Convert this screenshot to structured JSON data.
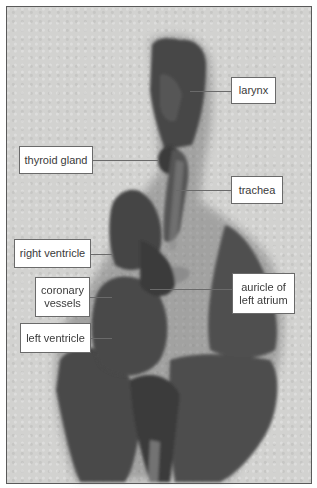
{
  "figure": {
    "labels": [
      {
        "id": "larynx",
        "text": "larynx"
      },
      {
        "id": "thyroid-gland",
        "text": "thyroid gland"
      },
      {
        "id": "trachea",
        "text": "trachea"
      },
      {
        "id": "right-ventricle",
        "text": "right ventricle"
      },
      {
        "id": "coronary-vessels",
        "line1": "coronary",
        "line2": "vessels"
      },
      {
        "id": "auricle-left-atrium",
        "line1": "auricle of",
        "line2": "left atrium"
      },
      {
        "id": "left-ventricle",
        "text": "left ventricle"
      }
    ]
  },
  "colors": {
    "background": "#d2d2d0",
    "tissue_dark": "#3c3c3c",
    "tissue_mid": "#5a5a5a",
    "label_border": "#6a6a6a"
  }
}
